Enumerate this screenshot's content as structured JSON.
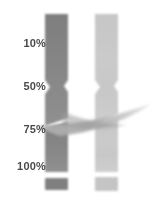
{
  "figure": {
    "kind": "gel-lane-diagram",
    "width": 154,
    "height": 204,
    "background_color": "#ffffff"
  },
  "axis": {
    "name": "percent-scale",
    "labels": [
      {
        "id": "p10",
        "text": "10%",
        "value": 10,
        "y": 43
      },
      {
        "id": "p50",
        "text": "50%",
        "value": 50,
        "y": 86
      },
      {
        "id": "p75",
        "text": "75%",
        "value": 75,
        "y": 129
      },
      {
        "id": "p100",
        "text": "100%",
        "value": 100,
        "y": 166
      }
    ],
    "text_color": "#4a4a4a"
  },
  "lanes": [
    {
      "id": "lane-left",
      "name": "left-lane",
      "color": "#838383",
      "x": 45,
      "width": 23,
      "top": 14,
      "bottom": 172
    },
    {
      "id": "lane-right",
      "name": "right-lane",
      "color": "#c9c9c9",
      "x": 95,
      "width": 23,
      "top": 14,
      "bottom": 172
    }
  ],
  "bands": [
    {
      "id": "band-left-bottom",
      "name": "left-bottom-band",
      "color": "#808080",
      "x": 45,
      "y": 178,
      "width": 23,
      "height": 12
    },
    {
      "id": "band-right-bottom",
      "name": "right-bottom-band",
      "color": "#c4c4c4",
      "x": 95,
      "y": 177,
      "width": 23,
      "height": 14
    }
  ],
  "swoosh": {
    "id": "swoosh-overlay",
    "name": "diagonal-swoosh",
    "color": "#b5b5b5",
    "start_x": 38,
    "end_x": 151,
    "crossing_level": "75%"
  },
  "notch": {
    "id": "lane-notch",
    "name": "mid-lane-notch",
    "level": "50%",
    "y": 82
  }
}
